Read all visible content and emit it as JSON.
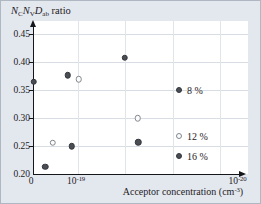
{
  "figure": {
    "ylabel_segments": [
      {
        "text": "N",
        "style": "italic"
      },
      {
        "text": "C",
        "style": "sub"
      },
      {
        "text": "N",
        "style": "italic"
      },
      {
        "text": "V",
        "style": "sub"
      },
      {
        "text": "D",
        "style": "italic"
      },
      {
        "text": "ab",
        "style": "sub"
      },
      {
        "text": " ratio",
        "style": "plain"
      }
    ],
    "colors": {
      "background": "#e3e8ef",
      "plot_background": "#ffffff",
      "gridline": "#d8dde4",
      "axis": "#15161a",
      "marker_filled": "#4a4e54",
      "marker_open_edge": "#83878d",
      "text": "#1f2023"
    }
  },
  "chart_data": {
    "type": "scatter",
    "xlabel": "Acceptor concentration (cm⁻³)",
    "xlabel_parts": {
      "pre": "Acceptor concentration (cm",
      "exp": "-3",
      "post": ")"
    },
    "ylabel": "N_C N_V D_ab ratio",
    "ylim": [
      0.2,
      0.465
    ],
    "grid": "on",
    "y_ticks": [
      0.45,
      0.4,
      0.35,
      0.3,
      0.25,
      0.2
    ],
    "x_ticks": [
      {
        "label": "0",
        "base": "0",
        "exp": null,
        "frac": -0.0095
      },
      {
        "label": "10⁻¹⁹",
        "base": "10",
        "exp": "-19",
        "frac": 0.205
      },
      {
        "label": "10⁻²⁰",
        "base": "10",
        "exp": "-20",
        "frac": 0.974
      }
    ],
    "v_gridline_fracs": [
      0.214,
      0.44,
      0.665,
      0.89
    ],
    "series": [
      {
        "name": "8 %",
        "marker": "filled",
        "points": [
          {
            "x_frac": 0.003,
            "y": 0.365
          },
          {
            "x_frac": 0.165,
            "y": 0.376
          },
          {
            "x_frac": 0.437,
            "y": 0.408
          }
        ]
      },
      {
        "name": "12 %",
        "marker": "open",
        "points": [
          {
            "x_frac": 0.094,
            "y": 0.256
          },
          {
            "x_frac": 0.218,
            "y": 0.369
          },
          {
            "x_frac": 0.499,
            "y": 0.3
          }
        ]
      },
      {
        "name": "16 %",
        "marker": "filled",
        "points": [
          {
            "x_frac": 0.059,
            "y": 0.213
          },
          {
            "x_frac": 0.184,
            "y": 0.25
          },
          {
            "x_frac": 0.501,
            "y": 0.257
          }
        ]
      }
    ],
    "legend": {
      "position": "right-middle",
      "items": [
        {
          "label": "8 %",
          "marker": "filled",
          "x_frac": 0.695,
          "y": 0.35
        },
        {
          "label": "12 %",
          "marker": "open",
          "x_frac": 0.695,
          "y": 0.268
        },
        {
          "label": "16 %",
          "marker": "filled",
          "x_frac": 0.695,
          "y": 0.232
        }
      ]
    }
  }
}
